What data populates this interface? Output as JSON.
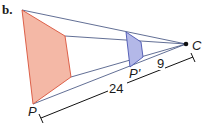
{
  "figure": {
    "part_label": "b.",
    "center_label": "C",
    "preimage_label": "P",
    "image_label": "P'",
    "dist_full": "24",
    "dist_image": "9",
    "colors": {
      "preimage_fill": "#f4b8a6",
      "preimage_stroke": "#d9523a",
      "image_fill": "#b3b8e8",
      "image_stroke": "#4a55b0",
      "ray": "#3a4a7a",
      "dimension": "#111111"
    }
  }
}
